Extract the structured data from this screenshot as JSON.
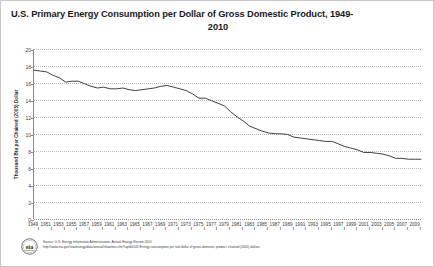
{
  "chart_data": {
    "type": "line",
    "title_line1": "U.S. Primary Energy Consumption per Dollar of Gross Domestic Product, 1949-",
    "title_line2": "2010",
    "xlabel": "",
    "ylabel": "Thousand Btu per Chained (2005) Dollar",
    "ylim": [
      0,
      20
    ],
    "xlim": [
      1949,
      2010
    ],
    "ytick_values": [
      0,
      2,
      4,
      6,
      8,
      10,
      12,
      14,
      16,
      18,
      20
    ],
    "ytick_labels": [
      "0",
      "2",
      "4",
      "6",
      "8",
      "10",
      "12",
      "14",
      "16",
      "18",
      "20"
    ],
    "xtick_labels": [
      "1949",
      "1951",
      "1953",
      "1955",
      "1957",
      "1959",
      "1961",
      "1963",
      "1965",
      "1967",
      "1969",
      "1971",
      "1973",
      "1975",
      "1977",
      "1979",
      "1981",
      "1983",
      "1985",
      "1987",
      "1989",
      "1991",
      "1993",
      "1995",
      "1997",
      "1999",
      "2001",
      "2003",
      "2005",
      "2007",
      "2009"
    ],
    "grid": true,
    "legend": false,
    "line_color": "#404040",
    "series": [
      {
        "name": "Energy Consumption per Dollar of GDP",
        "x": [
          1949,
          1950,
          1951,
          1952,
          1953,
          1954,
          1955,
          1956,
          1957,
          1958,
          1959,
          1960,
          1961,
          1962,
          1963,
          1964,
          1965,
          1966,
          1967,
          1968,
          1969,
          1970,
          1971,
          1972,
          1973,
          1974,
          1975,
          1976,
          1977,
          1978,
          1979,
          1980,
          1981,
          1982,
          1983,
          1984,
          1985,
          1986,
          1987,
          1988,
          1989,
          1990,
          1991,
          1992,
          1993,
          1994,
          1995,
          1996,
          1997,
          1998,
          1999,
          2000,
          2001,
          2002,
          2003,
          2004,
          2005,
          2006,
          2007,
          2008,
          2009,
          2010
        ],
        "values": [
          17.5,
          17.4,
          17.3,
          16.9,
          16.6,
          16.1,
          16.2,
          16.2,
          15.9,
          15.6,
          15.4,
          15.5,
          15.3,
          15.3,
          15.4,
          15.2,
          15.1,
          15.2,
          15.3,
          15.4,
          15.6,
          15.7,
          15.5,
          15.3,
          15.1,
          14.7,
          14.2,
          14.2,
          13.9,
          13.6,
          13.3,
          12.6,
          12.0,
          11.5,
          10.9,
          10.6,
          10.3,
          10.1,
          10.0,
          10.0,
          9.9,
          9.6,
          9.5,
          9.4,
          9.3,
          9.2,
          9.1,
          9.1,
          8.8,
          8.5,
          8.3,
          8.1,
          7.8,
          7.8,
          7.7,
          7.6,
          7.4,
          7.1,
          7.1,
          7.0,
          7.0,
          7.0
        ]
      }
    ]
  },
  "footer": {
    "logo_label": "eia",
    "line1": "Source: U.S. Energy Information Administration, Annual Energy Review 2010",
    "line2": "http://www.eia.gov/totalenergy/data/annual/showtext.cfm?t=ptb0105  Energy consumption per real dollar of gross domestic product, chained (2005) dollars."
  }
}
